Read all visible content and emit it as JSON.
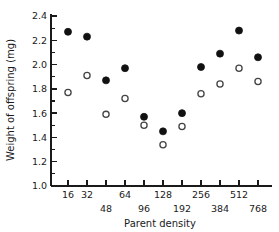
{
  "chart_data": {
    "type": "scatter",
    "title": "",
    "xlabel": "Parent density",
    "ylabel": "Weight of offspring (mg)",
    "xscale": "log2-like ordinal",
    "x_tick_labels": [
      "16",
      "32",
      "48",
      "64",
      "96",
      "128",
      "192",
      "256",
      "384",
      "512",
      "768"
    ],
    "x_tick_rows": [
      "upper",
      "upper",
      "lower",
      "upper",
      "lower",
      "upper",
      "lower",
      "upper",
      "lower",
      "upper",
      "lower"
    ],
    "y_tick_labels": [
      "1.0",
      "1.2",
      "1.4",
      "1.6",
      "1.8",
      "2.0",
      "2.2",
      "2.4"
    ],
    "y_tick_values": [
      1.0,
      1.2,
      1.4,
      1.6,
      1.8,
      2.0,
      2.2,
      2.4
    ],
    "ylim": [
      1.0,
      2.4
    ],
    "y_minor_step": 0.1,
    "grid": false,
    "legend": "none",
    "categories": [
      16,
      32,
      48,
      64,
      96,
      128,
      192,
      256,
      384,
      512,
      768
    ],
    "series": [
      {
        "name": "filled",
        "marker": "filled-circle",
        "color": "#111111",
        "values": [
          2.27,
          2.23,
          1.87,
          1.97,
          1.57,
          1.45,
          1.6,
          1.98,
          2.09,
          2.28,
          2.06
        ]
      },
      {
        "name": "open",
        "marker": "open-circle",
        "color": "#ffffff",
        "values": [
          1.77,
          1.91,
          1.59,
          1.72,
          1.5,
          1.34,
          1.49,
          1.76,
          1.84,
          1.97,
          1.86
        ]
      }
    ]
  }
}
